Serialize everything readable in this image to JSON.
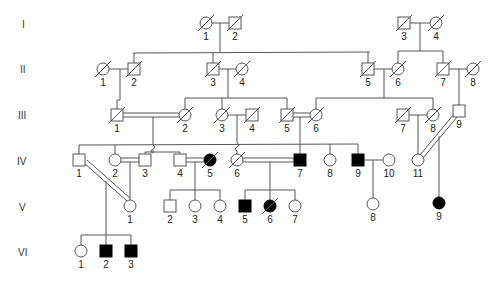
{
  "generations": [
    "I",
    "II",
    "III",
    "IV",
    "V",
    "VI"
  ],
  "individuals": [
    {
      "id": "I-1",
      "label": "1",
      "sex": "F",
      "affected": false,
      "deceased": true,
      "x": 206,
      "y": 23
    },
    {
      "id": "I-2",
      "label": "2",
      "sex": "M",
      "affected": false,
      "deceased": true,
      "x": 235,
      "y": 23
    },
    {
      "id": "I-3",
      "label": "3",
      "sex": "M",
      "affected": false,
      "deceased": true,
      "x": 404,
      "y": 23
    },
    {
      "id": "I-4",
      "label": "4",
      "sex": "F",
      "affected": false,
      "deceased": true,
      "x": 436,
      "y": 23
    },
    {
      "id": "II-1",
      "label": "1",
      "sex": "F",
      "affected": false,
      "deceased": true,
      "x": 103,
      "y": 69
    },
    {
      "id": "II-2",
      "label": "2",
      "sex": "M",
      "affected": false,
      "deceased": true,
      "x": 134,
      "y": 69
    },
    {
      "id": "II-3",
      "label": "3",
      "sex": "M",
      "affected": false,
      "deceased": true,
      "x": 213,
      "y": 69
    },
    {
      "id": "II-4",
      "label": "4",
      "sex": "F",
      "affected": false,
      "deceased": true,
      "x": 242,
      "y": 69
    },
    {
      "id": "II-5",
      "label": "5",
      "sex": "M",
      "affected": false,
      "deceased": true,
      "x": 368,
      "y": 69
    },
    {
      "id": "II-6",
      "label": "6",
      "sex": "F",
      "affected": false,
      "deceased": true,
      "x": 398,
      "y": 69
    },
    {
      "id": "II-7",
      "label": "7",
      "sex": "M",
      "affected": false,
      "deceased": true,
      "x": 443,
      "y": 69
    },
    {
      "id": "II-8",
      "label": "8",
      "sex": "F",
      "affected": false,
      "deceased": true,
      "x": 473,
      "y": 69
    },
    {
      "id": "III-1",
      "label": "1",
      "sex": "M",
      "affected": false,
      "deceased": true,
      "x": 117,
      "y": 115
    },
    {
      "id": "III-2",
      "label": "2",
      "sex": "F",
      "affected": false,
      "deceased": true,
      "x": 185,
      "y": 115
    },
    {
      "id": "III-3",
      "label": "3",
      "sex": "F",
      "affected": false,
      "deceased": true,
      "x": 222,
      "y": 115
    },
    {
      "id": "III-4",
      "label": "4",
      "sex": "M",
      "affected": false,
      "deceased": true,
      "x": 252,
      "y": 115
    },
    {
      "id": "III-5",
      "label": "5",
      "sex": "M",
      "affected": false,
      "deceased": true,
      "x": 287,
      "y": 115
    },
    {
      "id": "III-6",
      "label": "6",
      "sex": "F",
      "affected": false,
      "deceased": true,
      "x": 316,
      "y": 115
    },
    {
      "id": "III-7",
      "label": "7",
      "sex": "M",
      "affected": false,
      "deceased": true,
      "x": 403,
      "y": 115
    },
    {
      "id": "III-8",
      "label": "8",
      "sex": "F",
      "affected": false,
      "deceased": true,
      "x": 433,
      "y": 115
    },
    {
      "id": "III-9",
      "label": "9",
      "sex": "M",
      "affected": false,
      "deceased": false,
      "x": 459,
      "y": 111
    },
    {
      "id": "IV-1",
      "label": "1",
      "sex": "M",
      "affected": false,
      "deceased": false,
      "x": 79,
      "y": 160
    },
    {
      "id": "IV-2",
      "label": "2",
      "sex": "F",
      "affected": false,
      "deceased": false,
      "x": 115,
      "y": 160
    },
    {
      "id": "IV-3",
      "label": "3",
      "sex": "M",
      "affected": false,
      "deceased": false,
      "x": 145,
      "y": 160
    },
    {
      "id": "IV-4",
      "label": "4",
      "sex": "M",
      "affected": false,
      "deceased": false,
      "x": 180,
      "y": 160
    },
    {
      "id": "IV-5",
      "label": "5",
      "sex": "F",
      "affected": true,
      "deceased": true,
      "x": 210,
      "y": 160
    },
    {
      "id": "IV-6",
      "label": "6",
      "sex": "F",
      "affected": false,
      "deceased": true,
      "x": 237,
      "y": 160
    },
    {
      "id": "IV-7",
      "label": "7",
      "sex": "M",
      "affected": true,
      "deceased": false,
      "x": 300,
      "y": 160
    },
    {
      "id": "IV-8",
      "label": "8",
      "sex": "F",
      "affected": false,
      "deceased": false,
      "x": 330,
      "y": 160
    },
    {
      "id": "IV-9",
      "label": "9",
      "sex": "M",
      "affected": true,
      "deceased": false,
      "x": 358,
      "y": 160
    },
    {
      "id": "IV-10",
      "label": "10",
      "sex": "F",
      "affected": false,
      "deceased": false,
      "x": 389,
      "y": 160
    },
    {
      "id": "IV-11",
      "label": "11",
      "sex": "F",
      "affected": false,
      "deceased": false,
      "x": 418,
      "y": 160
    },
    {
      "id": "V-1",
      "label": "1",
      "sex": "F",
      "affected": false,
      "deceased": false,
      "x": 130,
      "y": 206
    },
    {
      "id": "V-2",
      "label": "2",
      "sex": "M",
      "affected": false,
      "deceased": false,
      "x": 170,
      "y": 206
    },
    {
      "id": "V-3",
      "label": "3",
      "sex": "F",
      "affected": false,
      "deceased": false,
      "x": 195,
      "y": 206
    },
    {
      "id": "V-4",
      "label": "4",
      "sex": "F",
      "affected": false,
      "deceased": false,
      "x": 220,
      "y": 206
    },
    {
      "id": "V-5",
      "label": "5",
      "sex": "M",
      "affected": true,
      "deceased": false,
      "x": 245,
      "y": 206
    },
    {
      "id": "V-6",
      "label": "6",
      "sex": "F",
      "affected": true,
      "deceased": true,
      "x": 270,
      "y": 206
    },
    {
      "id": "V-7",
      "label": "7",
      "sex": "F",
      "affected": false,
      "deceased": false,
      "x": 295,
      "y": 206
    },
    {
      "id": "V-8",
      "label": "8",
      "sex": "F",
      "affected": false,
      "deceased": false,
      "x": 373,
      "y": 204
    },
    {
      "id": "V-9",
      "label": "9",
      "sex": "F",
      "affected": true,
      "deceased": false,
      "x": 439,
      "y": 203
    },
    {
      "id": "VI-1",
      "label": "1",
      "sex": "F",
      "affected": false,
      "deceased": false,
      "x": 81,
      "y": 251
    },
    {
      "id": "VI-2",
      "label": "2",
      "sex": "M",
      "affected": true,
      "deceased": false,
      "x": 106,
      "y": 251
    },
    {
      "id": "VI-3",
      "label": "3",
      "sex": "M",
      "affected": true,
      "deceased": false,
      "x": 131,
      "y": 251
    }
  ],
  "colors": {
    "line": "#555555",
    "affected": "#000000",
    "unaffected": "#ffffff",
    "text": "#222222"
  }
}
